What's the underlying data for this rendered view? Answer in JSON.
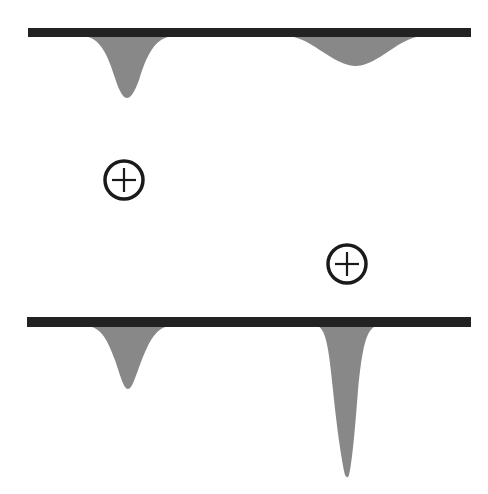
{
  "diagram": {
    "colors": {
      "surface": "#222222",
      "depression": "#888888",
      "charge_stroke": "#1a1a1a",
      "background": "#ffffff"
    },
    "surfaces": [
      {
        "id": "top",
        "x1": 28,
        "x2": 471,
        "y": 28,
        "thickness": 9
      },
      {
        "id": "bottom",
        "x1": 27,
        "x2": 471,
        "y": 317,
        "thickness": 10
      }
    ],
    "depressions": [
      {
        "surface": "top",
        "center_x": 126,
        "left_x": 82,
        "right_x": 175,
        "depth_y": 98,
        "shape": "narrow-deep"
      },
      {
        "surface": "top",
        "center_x": 355,
        "left_x": 285,
        "right_x": 425,
        "depth_y": 65,
        "shape": "wide-shallow"
      },
      {
        "surface": "bottom",
        "center_x": 127,
        "left_x": 85,
        "right_x": 172,
        "depth_y": 389,
        "shape": "narrow-deep"
      },
      {
        "surface": "bottom",
        "center_x": 347,
        "left_x": 316,
        "right_x": 378,
        "depth_y": 475,
        "shape": "very-narrow-very-deep"
      }
    ],
    "charges": [
      {
        "id": "charge-1",
        "sign": "+",
        "cx": 124,
        "cy": 180,
        "r": 19
      },
      {
        "id": "charge-2",
        "sign": "+",
        "cx": 347,
        "cy": 264,
        "r": 19
      }
    ]
  }
}
